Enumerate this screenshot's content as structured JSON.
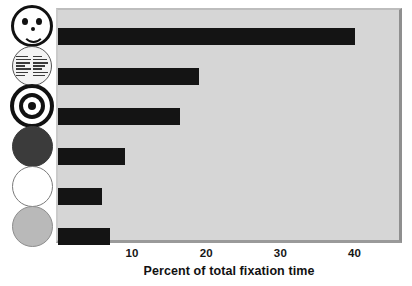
{
  "chart_data": {
    "type": "bar",
    "orientation": "horizontal",
    "title": "",
    "xlabel": "Percent of total fixation time",
    "ylabel": "",
    "xlim": [
      0,
      46
    ],
    "xticks": [
      10,
      20,
      30,
      40
    ],
    "xtick_labels": [
      "10",
      "20",
      "30",
      "40"
    ],
    "grid": false,
    "legend": "none",
    "categories": [
      "face",
      "newsprint",
      "bullseye",
      "red-disc",
      "white-disc",
      "yellow-disc"
    ],
    "category_icons": [
      "smiley-face-icon",
      "newsprint-circle-icon",
      "bullseye-icon",
      "dark-filled-circle-icon",
      "white-circle-icon",
      "gray-filled-circle-icon"
    ],
    "values": [
      40.0,
      19.0,
      16.5,
      9.0,
      6.0,
      7.0
    ],
    "bar_color": "#141414",
    "plot_background": "#d6d6d6"
  },
  "axis": {
    "title": "Percent of total fixation time",
    "ticks": [
      {
        "label": "10",
        "value": 10
      },
      {
        "label": "20",
        "value": 20
      },
      {
        "label": "30",
        "value": 30
      },
      {
        "label": "40",
        "value": 40
      }
    ]
  },
  "stimuli": [
    {
      "name": "smiley-face-icon",
      "label": "face"
    },
    {
      "name": "newsprint-circle-icon",
      "label": "newsprint"
    },
    {
      "name": "bullseye-icon",
      "label": "bullseye"
    },
    {
      "name": "dark-filled-circle-icon",
      "label": "red disc"
    },
    {
      "name": "white-circle-icon",
      "label": "white disc"
    },
    {
      "name": "gray-filled-circle-icon",
      "label": "yellow disc"
    }
  ],
  "colors": {
    "bar": "#141414",
    "panel": "#d6d6d6",
    "panel_border": "#8f8f8f",
    "text": "#111111"
  }
}
